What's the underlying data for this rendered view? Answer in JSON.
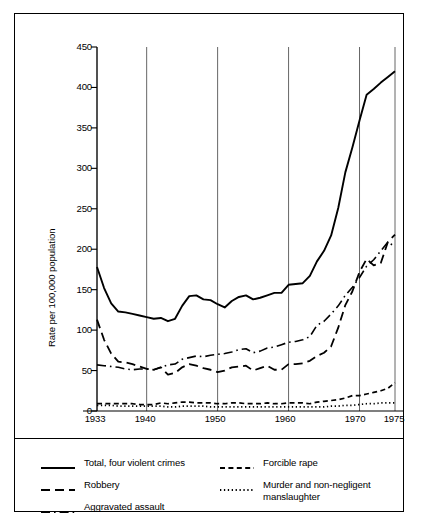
{
  "chart_data": {
    "type": "line",
    "title": "",
    "xlabel": "",
    "ylabel": "Rate per 100,000 population",
    "xlim": [
      1933,
      1975
    ],
    "ylim": [
      0,
      450
    ],
    "yticks": [
      0,
      50,
      100,
      150,
      200,
      250,
      300,
      350,
      400,
      450
    ],
    "xticks": [
      1933,
      1940,
      1950,
      1960,
      1970,
      1975
    ],
    "xtick_labels": [
      "1933",
      "1940",
      "1950",
      "1960",
      "1970",
      "1975"
    ],
    "gridlines": "vertical at xticks",
    "legend_position": "below-plot",
    "x": [
      1933,
      1934,
      1935,
      1936,
      1937,
      1938,
      1939,
      1940,
      1941,
      1942,
      1943,
      1944,
      1945,
      1946,
      1947,
      1948,
      1949,
      1950,
      1951,
      1952,
      1953,
      1954,
      1955,
      1956,
      1957,
      1958,
      1959,
      1960,
      1961,
      1962,
      1963,
      1964,
      1965,
      1966,
      1967,
      1968,
      1969,
      1970,
      1971,
      1972,
      1973,
      1974,
      1975
    ],
    "series": [
      {
        "name": "Total, four violent crimes",
        "style": "solid",
        "values": [
          178,
          152,
          133,
          123,
          122,
          120,
          118,
          116,
          114,
          115,
          111,
          114,
          130,
          142,
          143,
          138,
          137,
          132,
          128,
          136,
          141,
          143,
          138,
          140,
          143,
          146,
          146,
          156,
          157,
          158,
          167,
          185,
          198,
          217,
          251,
          295,
          326,
          359,
          391,
          398,
          406,
          413,
          420
        ]
      },
      {
        "name": "Robbery",
        "style": "dashed",
        "values": [
          113,
          88,
          71,
          61,
          60,
          58,
          55,
          52,
          51,
          54,
          45,
          47,
          54,
          58,
          56,
          53,
          51,
          48,
          50,
          54,
          55,
          56,
          50,
          53,
          56,
          51,
          51,
          58,
          58,
          59,
          62,
          68,
          72,
          80,
          103,
          131,
          148,
          172,
          188,
          180,
          183,
          209,
          218
        ]
      },
      {
        "name": "Aggravated assault",
        "style": "dashdot",
        "values": [
          57,
          56,
          55,
          54,
          52,
          51,
          52,
          52,
          51,
          54,
          57,
          58,
          64,
          66,
          68,
          67,
          69,
          70,
          71,
          73,
          76,
          77,
          72,
          74,
          78,
          79,
          82,
          85,
          86,
          88,
          92,
          106,
          111,
          120,
          130,
          143,
          153,
          165,
          179,
          187,
          198,
          209,
          203
        ]
      },
      {
        "name": "Forcible rape",
        "style": "dashed-small",
        "values": [
          9,
          9,
          9,
          9,
          9,
          9,
          8,
          8,
          8,
          10,
          9,
          10,
          11,
          11,
          10,
          10,
          10,
          9,
          9,
          10,
          10,
          9,
          9,
          9,
          10,
          9,
          9,
          10,
          10,
          10,
          9,
          11,
          12,
          13,
          14,
          16,
          19,
          19,
          21,
          23,
          25,
          28,
          35
        ]
      },
      {
        "name": "Murder and non-negligent manslaughter",
        "style": "dotted",
        "values": [
          7,
          7,
          7,
          6,
          6,
          6,
          6,
          6,
          6,
          6,
          5,
          5,
          6,
          6,
          6,
          6,
          5,
          5,
          5,
          5,
          5,
          5,
          5,
          5,
          5,
          5,
          5,
          5,
          5,
          5,
          5,
          5,
          5,
          6,
          6,
          7,
          7,
          8,
          9,
          9,
          10,
          10,
          10
        ]
      }
    ]
  },
  "axis": {
    "ylabel": "Rate per 100,000 population",
    "ytick_labels": [
      "450",
      "400",
      "350",
      "300",
      "250",
      "200",
      "150",
      "100",
      "50",
      "0"
    ],
    "xtick_labels": [
      "1933",
      "1940",
      "1950",
      "1960",
      "1970",
      "1975"
    ]
  },
  "legend": {
    "left_column": [
      {
        "label": "Total, four violent crimes",
        "style": "solid",
        "icon": "solid-line-icon"
      },
      {
        "label": "Robbery",
        "style": "dashed",
        "icon": "dashed-line-icon"
      },
      {
        "label": "Aggravated assault",
        "style": "dashdot",
        "icon": "dash-dot-line-icon"
      }
    ],
    "right_column": [
      {
        "label": "Forcible rape",
        "style": "dashed-small",
        "icon": "dashed-line-icon"
      },
      {
        "label": "Murder and non-negligent\nmanslaughter",
        "style": "dotted",
        "icon": "dotted-line-icon"
      }
    ]
  },
  "colors": {
    "ink": "#000000",
    "grid": "#555555",
    "background": "#ffffff"
  }
}
